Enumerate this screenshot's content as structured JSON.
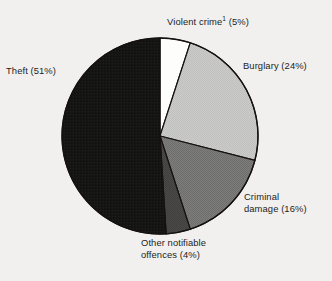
{
  "chart_data": {
    "type": "pie",
    "title": "",
    "subtitle": "",
    "xlabel": "",
    "ylabel": "",
    "legend_position": "none",
    "grid": false,
    "start_angle_deg": 0,
    "direction": "clockwise",
    "center": {
      "x": 160,
      "y": 136
    },
    "radius": 98,
    "categories": [
      "Violent crime",
      "Burglary",
      "Criminal damage",
      "Other notifiable offences",
      "Theft"
    ],
    "values": [
      5,
      24,
      16,
      4,
      51
    ],
    "unit": "%",
    "slices": [
      {
        "name": "violent-crime",
        "label_line1": "Violent crime",
        "label_superscript": "1",
        "label_line2": " (5%)",
        "label_full": "Violent crime1 (5%)",
        "value": 5,
        "start_deg": 0,
        "end_deg": 18,
        "color": "#fdfdfc"
      },
      {
        "name": "burglary",
        "label_line1": "Burglary (24%)",
        "label_superscript": "",
        "label_line2": "",
        "label_full": "Burglary (24%)",
        "value": 24,
        "start_deg": 18,
        "end_deg": 104.4,
        "color": "#c8c8c6"
      },
      {
        "name": "criminal-damage",
        "label_line1": "Criminal",
        "label_superscript": "",
        "label_line2": "damage (16%)",
        "label_full": "Criminal damage (16%)",
        "value": 16,
        "start_deg": 104.4,
        "end_deg": 162,
        "color": "#797977"
      },
      {
        "name": "other-notifiable-offences",
        "label_line1": "Other notifiable",
        "label_superscript": "",
        "label_line2": "offences (4%)",
        "label_full": "Other notifiable offences (4%)",
        "value": 4,
        "start_deg": 162,
        "end_deg": 176.4,
        "color": "#474745"
      },
      {
        "name": "theft",
        "label_line1": "Theft (51%)",
        "label_superscript": "",
        "label_line2": "",
        "label_full": "Theft (51%)",
        "value": 51,
        "start_deg": 176.4,
        "end_deg": 360,
        "color": "#141414"
      }
    ],
    "colors": {
      "background": "#f1f0ee",
      "outline": "#15110f",
      "text": "#1d1d1d"
    }
  }
}
